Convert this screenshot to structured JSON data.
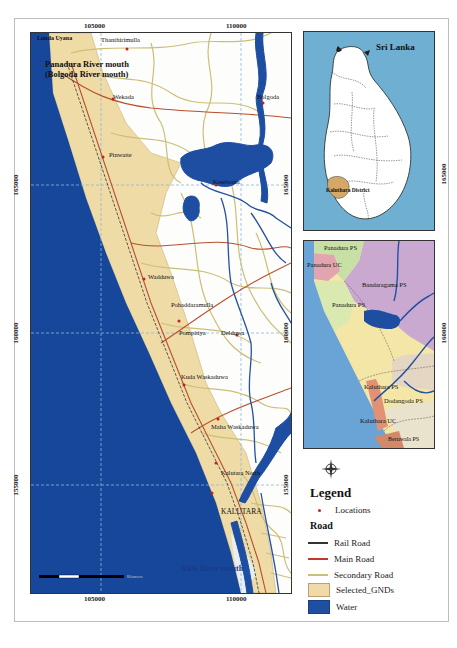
{
  "main_map": {
    "x_ticks": [
      "105000",
      "110000"
    ],
    "y_ticks": [
      "165000",
      "160000",
      "155000"
    ],
    "places": [
      {
        "name": "Panadura River mouth",
        "sub": "(Bolgoda River mouth)"
      },
      {
        "name": "Thanthirimulla"
      },
      {
        "name": "Wekada"
      },
      {
        "name": "Bolgoda"
      },
      {
        "name": "Pinwatte"
      },
      {
        "name": "Keselwatta"
      },
      {
        "name": "Wadduwa"
      },
      {
        "name": "Pohaddaramulla"
      },
      {
        "name": "Pompitiya"
      },
      {
        "name": "Delduwa"
      },
      {
        "name": "Kuda Waskaduwa"
      },
      {
        "name": "Maha Waskaduwa"
      },
      {
        "name": "Kalutara North"
      },
      {
        "name": "KALUTARA"
      },
      {
        "name": "Kalu River mouth"
      },
      {
        "name": "Lunda Uyana"
      }
    ],
    "scale_bar_label": "Kilometers"
  },
  "inset_srilanka": {
    "title": "Sri Lanka",
    "district_label": "Kaluthara District",
    "x_tick": "165000"
  },
  "inset_admin": {
    "labels": [
      "Panadura PS",
      "Panadura UC",
      "Bandaragama PS",
      "Panadura PS",
      "Kaluthara PS",
      "Dodangoda PS",
      "Kaluthara UC",
      "Beruwala PS"
    ],
    "y_tick": "160000"
  },
  "legend": {
    "title": "Legend",
    "locations_label": "Locations",
    "road_heading": "Road",
    "items": [
      {
        "label": "Rail Road",
        "color": "#333333",
        "type": "line"
      },
      {
        "label": "Main Road",
        "color": "#c0392b",
        "type": "line"
      },
      {
        "label": "Secondary Road",
        "color": "#c9c07a",
        "type": "line"
      },
      {
        "label": "Selected_GNDs",
        "color": "#f0dba8",
        "type": "fill"
      },
      {
        "label": "Water",
        "color": "#1e4fa0",
        "type": "fill"
      }
    ]
  },
  "colors": {
    "sea": "#17479a",
    "gnd_fill": "#efdba6",
    "secondary_road": "#cbbf78",
    "main_road": "#b8502e",
    "water": "#1d4ea2",
    "grid": "#8bb8d8"
  }
}
